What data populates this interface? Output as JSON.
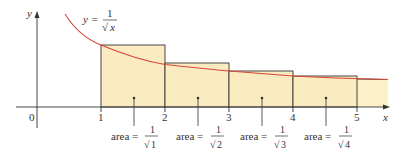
{
  "figure": {
    "curve_label": {
      "lhs": "y =",
      "num": "1",
      "den": "x"
    },
    "axes": {
      "x_label": "x",
      "y_label": "y",
      "origin": "0",
      "ticks": [
        "1",
        "2",
        "3",
        "4",
        "5"
      ]
    },
    "areas": [
      {
        "label": "area =",
        "num": "1",
        "den": "1"
      },
      {
        "label": "area =",
        "num": "1",
        "den": "2"
      },
      {
        "label": "area =",
        "num": "1",
        "den": "3"
      },
      {
        "label": "area =",
        "num": "1",
        "den": "4"
      }
    ],
    "colors": {
      "fill": "#faecc0",
      "curve": "#d9463a",
      "stroke": "#333333"
    }
  }
}
